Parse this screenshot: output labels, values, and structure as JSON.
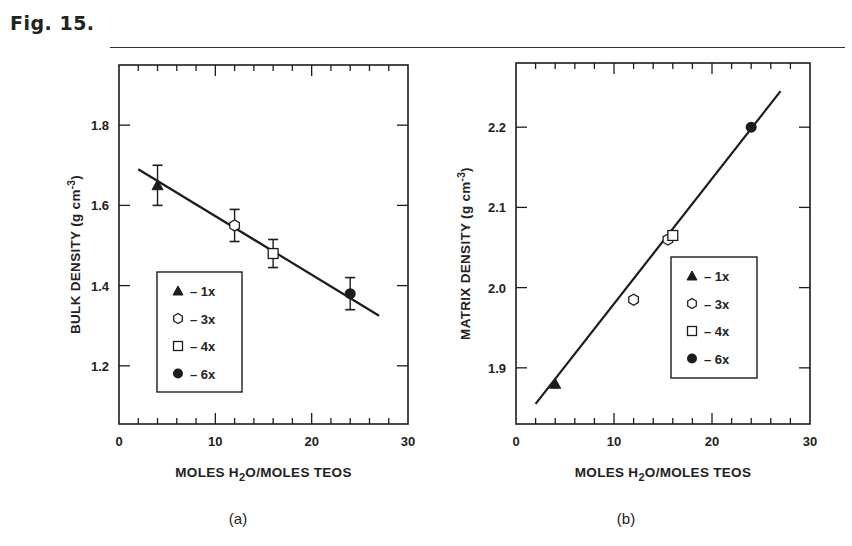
{
  "figure": {
    "label": "Fig. 15."
  },
  "chart_data": [
    {
      "type": "scatter",
      "panel": "(a)",
      "title": "",
      "xlabel": "MOLES H2O/MOLES TEOS",
      "xlabel_parts": {
        "pre": "MOLES H",
        "sub": "2",
        "post": "O/MOLES TEOS"
      },
      "ylabel": "BULK DENSITY (g cm-3)",
      "ylabel_parts": {
        "pre": "BULK DENSITY  (g cm",
        "sup": "-3",
        "post": ")"
      },
      "xlim": [
        0,
        30
      ],
      "ylim": [
        1.055,
        1.95
      ],
      "x_ticks": [
        0,
        10,
        20,
        30
      ],
      "x_tick_labels": [
        "0",
        "10",
        "20",
        "30"
      ],
      "y_ticks": [
        1.2,
        1.4,
        1.6,
        1.8
      ],
      "y_tick_labels": [
        "1.2",
        "1.4",
        "1.6",
        "1.8"
      ],
      "grid": false,
      "legend_position": "lower left (inside)",
      "legend": [
        {
          "marker": "filled-triangle",
          "label": "– 1x"
        },
        {
          "marker": "open-hexagon",
          "label": "– 3x"
        },
        {
          "marker": "open-square",
          "label": "– 4x"
        },
        {
          "marker": "filled-circle",
          "label": "– 6x"
        }
      ],
      "series": [
        {
          "name": "1x",
          "marker": "filled-triangle",
          "x": 4,
          "y": 1.65,
          "yerr": 0.05
        },
        {
          "name": "3x",
          "marker": "open-hexagon",
          "x": 12,
          "y": 1.55,
          "yerr": 0.04
        },
        {
          "name": "4x",
          "marker": "open-square",
          "x": 16,
          "y": 1.48,
          "yerr": 0.035
        },
        {
          "name": "6x",
          "marker": "filled-circle",
          "x": 24,
          "y": 1.38,
          "yerr": 0.04
        }
      ],
      "fit_line": {
        "x": [
          2,
          27
        ],
        "y": [
          1.69,
          1.325
        ]
      }
    },
    {
      "type": "scatter",
      "panel": "(b)",
      "title": "",
      "xlabel": "MOLES H2O/MOLES TEOS",
      "xlabel_parts": {
        "pre": "MOLES H",
        "sub": "2",
        "post": "O/MOLES TEOS"
      },
      "ylabel": "MATRIX DENSITY (g cm-3)",
      "ylabel_parts": {
        "pre": "MATRIX DENSITY  (g cm",
        "sup": "-3",
        "post": ")"
      },
      "xlim": [
        0,
        30
      ],
      "ylim": [
        1.83,
        2.28
      ],
      "x_ticks": [
        0,
        10,
        20,
        30
      ],
      "x_tick_labels": [
        "0",
        "10",
        "20",
        "30"
      ],
      "y_ticks": [
        1.9,
        2.0,
        2.1,
        2.2
      ],
      "y_tick_labels": [
        "1.9",
        "2.0",
        "2.1",
        "2.2"
      ],
      "grid": false,
      "legend_position": "lower right (inside)",
      "legend": [
        {
          "marker": "filled-triangle",
          "label": "– 1x"
        },
        {
          "marker": "open-hexagon",
          "label": "– 3x"
        },
        {
          "marker": "open-square",
          "label": "– 4x"
        },
        {
          "marker": "filled-circle",
          "label": "– 6x"
        }
      ],
      "series": [
        {
          "name": "1x",
          "marker": "filled-triangle",
          "x": 4,
          "y": 1.88
        },
        {
          "name": "3x",
          "marker": "open-hexagon",
          "x": 12,
          "y": 1.985
        },
        {
          "name": "3x",
          "marker": "open-hexagon",
          "x": 15.5,
          "y": 2.06
        },
        {
          "name": "4x",
          "marker": "open-square",
          "x": 16,
          "y": 2.065
        },
        {
          "name": "6x",
          "marker": "filled-circle",
          "x": 24,
          "y": 2.2
        }
      ],
      "fit_line": {
        "x": [
          2,
          27
        ],
        "y": [
          1.855,
          2.245
        ]
      }
    }
  ]
}
